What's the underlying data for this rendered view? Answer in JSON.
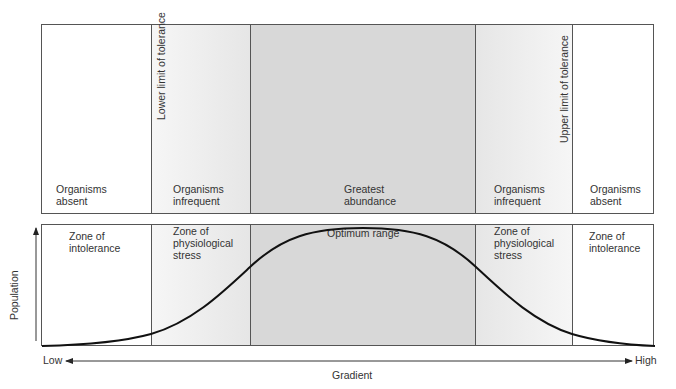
{
  "top_panel": {
    "zones": [
      {
        "label_line1": "Organisms",
        "label_line2": "absent"
      },
      {
        "label_line1": "Organisms",
        "label_line2": "infrequent"
      },
      {
        "label_line1": "Greatest",
        "label_line2": "abundance"
      },
      {
        "label_line1": "Organisms",
        "label_line2": "infrequent"
      },
      {
        "label_line1": "Organisms",
        "label_line2": "absent"
      }
    ],
    "lower_limit_label": "Lower limit of tolerance",
    "upper_limit_label": "Upper limit of tolerance"
  },
  "bottom_panel": {
    "zones": [
      {
        "line1": "Zone of",
        "line2": "intolerance",
        "line3": ""
      },
      {
        "line1": "Zone of",
        "line2": "physiological",
        "line3": "stress"
      },
      {
        "line1": "Optimum range",
        "line2": "",
        "line3": ""
      },
      {
        "line1": "Zone of",
        "line2": "physiological",
        "line3": "stress"
      },
      {
        "line1": "Zone of",
        "line2": "intolerance",
        "line3": ""
      }
    ]
  },
  "axes": {
    "y_label": "Population",
    "x_label": "Gradient",
    "x_low": "Low",
    "x_high": "High"
  },
  "colors": {
    "optimum_fill": "#d8d8d8",
    "stress_fill": "#ececec",
    "absent_fill": "#ffffff",
    "line": "#111111"
  }
}
